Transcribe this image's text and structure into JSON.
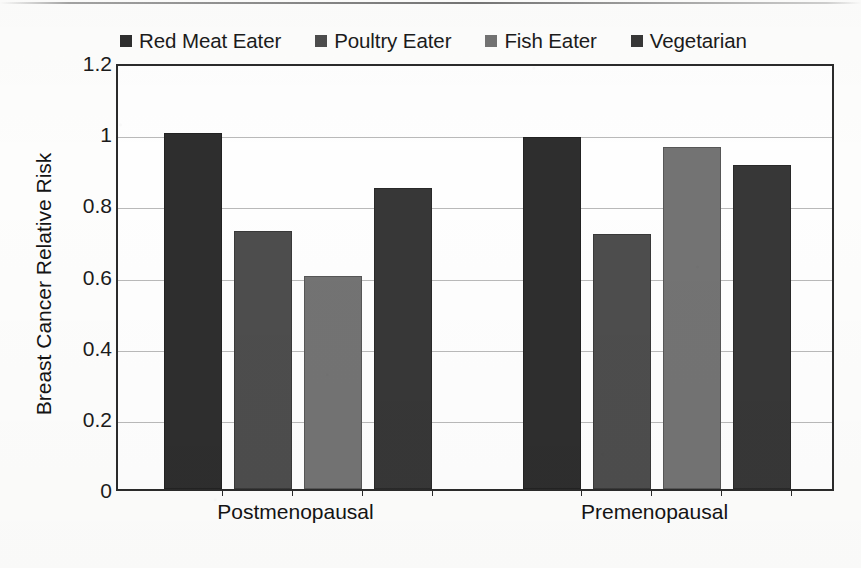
{
  "chart_data": {
    "type": "bar",
    "title": "",
    "xlabel": "",
    "ylabel": "Breast Cancer Relative Risk",
    "categories": [
      "Postmenopausal",
      "Premenopausal"
    ],
    "ylim": [
      0,
      1.2
    ],
    "ytick_labels": [
      "0",
      "0.2",
      "0.4",
      "0.6",
      "0.8",
      "1",
      "1.2"
    ],
    "ytick_values": [
      0,
      0.2,
      0.4,
      0.6,
      0.8,
      1,
      1.2
    ],
    "grid": true,
    "legend_position": "top",
    "series": [
      {
        "name": "Red Meat Eater",
        "color": "#2e2e2e",
        "values": [
          1.0,
          0.99
        ]
      },
      {
        "name": "Poultry Eater",
        "color": "#4d4d4d",
        "values": [
          0.726,
          0.716
        ]
      },
      {
        "name": "Fish Eater",
        "color": "#737373",
        "values": [
          0.598,
          0.962
        ]
      },
      {
        "name": "Vegetarian",
        "color": "#373737",
        "values": [
          0.847,
          0.911
        ]
      }
    ]
  },
  "legend": {
    "items": [
      {
        "label": "Red Meat Eater",
        "color": "#2e2e2e"
      },
      {
        "label": "Poultry Eater",
        "color": "#4d4d4d"
      },
      {
        "label": "Fish Eater",
        "color": "#737373"
      },
      {
        "label": "Vegetarian",
        "color": "#373737"
      }
    ]
  },
  "axes": {
    "y_title": "Breast Cancer Relative Risk",
    "y_ticks": [
      "1.2",
      "1",
      "0.8",
      "0.6",
      "0.4",
      "0.2",
      "0"
    ],
    "x_ticks": [
      "Postmenopausal",
      "Premenopausal"
    ]
  }
}
